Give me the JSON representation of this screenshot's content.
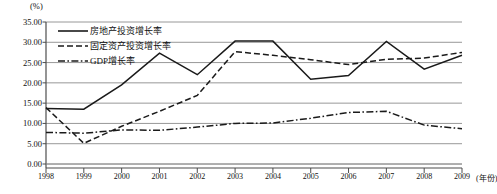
{
  "chart_data": {
    "type": "line",
    "title": "",
    "xlabel": "(年份)",
    "ylabel": "(%)",
    "unit_top_left": "(%)",
    "x": [
      1998,
      1999,
      2000,
      2001,
      2002,
      2003,
      2004,
      2005,
      2006,
      2007,
      2008,
      2009
    ],
    "categories": [
      "1998",
      "1999",
      "2000",
      "2001",
      "2002",
      "2003",
      "2004",
      "2005",
      "2006",
      "2007",
      "2008",
      "2009"
    ],
    "ylim": [
      0,
      35
    ],
    "ytick_labels": [
      "0.00",
      "5.00",
      "10.00",
      "15.00",
      "20.00",
      "25.00",
      "30.00",
      "35.00"
    ],
    "ytick_values": [
      0,
      5,
      10,
      15,
      20,
      25,
      30,
      35
    ],
    "grid": true,
    "legend_position": "top-left",
    "series": [
      {
        "name": "房地产投资增长率",
        "style": "solid",
        "color": "#1a1a1a",
        "values": [
          13.7,
          13.5,
          19.5,
          27.3,
          22.0,
          30.3,
          30.3,
          20.9,
          21.8,
          30.2,
          23.4,
          26.8
        ]
      },
      {
        "name": "固定资产投资增长率",
        "style": "dashed",
        "color": "#1a1a1a",
        "values": [
          13.9,
          5.1,
          9.3,
          13.0,
          16.9,
          27.7,
          26.8,
          25.7,
          24.5,
          25.8,
          26.1,
          27.5
        ]
      },
      {
        "name": "GDP增长率",
        "style": "dashdot",
        "color": "#1a1a1a",
        "values": [
          7.8,
          7.6,
          8.4,
          8.3,
          9.1,
          10.0,
          10.1,
          11.3,
          12.7,
          13.0,
          9.6,
          8.7
        ]
      }
    ]
  },
  "legend": {
    "items": [
      {
        "label": "房地产投资增长率",
        "style": "solid"
      },
      {
        "label": "固定资产投资增长率",
        "style": "dashed"
      },
      {
        "label": "GDP增长率",
        "style": "dashdot"
      }
    ]
  },
  "axes": {
    "y_unit": "(%)",
    "x_unit": "(年份)"
  }
}
